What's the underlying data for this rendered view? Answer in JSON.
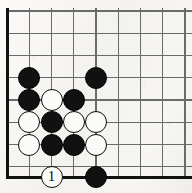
{
  "figure": {
    "kind": "go-board-diagram",
    "title": "",
    "board": {
      "width_px": 192,
      "height_px": 193,
      "background_color": "#f6f5f3",
      "line_color": "#6b6b6b",
      "edge_color": "#111111",
      "grid_spacing_px": 22.25,
      "stone_radius_px": 11,
      "columns_x": [
        7,
        29.25,
        51.5,
        73.75,
        96,
        118.25,
        140.5,
        162.75,
        185
      ],
      "rows_y": [
        11,
        33.25,
        55.5,
        77.75,
        100,
        122.25,
        144.5,
        166.75,
        178.5
      ],
      "edges": {
        "left": true,
        "bottom": true,
        "top": false,
        "right": false
      },
      "corner": "bottom-left"
    },
    "stones": [
      {
        "id": "b1",
        "color": "black",
        "col": 1,
        "row": 3,
        "x": 29.25,
        "y": 77.75,
        "label": ""
      },
      {
        "id": "b2",
        "color": "black",
        "col": 4,
        "row": 3,
        "x": 96.0,
        "y": 77.75,
        "label": ""
      },
      {
        "id": "b3",
        "color": "black",
        "col": 1,
        "row": 4,
        "x": 29.25,
        "y": 100.0,
        "label": ""
      },
      {
        "id": "w1",
        "color": "white",
        "col": 2,
        "row": 4,
        "x": 51.5,
        "y": 100.0,
        "label": ""
      },
      {
        "id": "b4",
        "color": "black",
        "col": 3,
        "row": 4,
        "x": 73.75,
        "y": 100.0,
        "label": ""
      },
      {
        "id": "w2",
        "color": "white",
        "col": 1,
        "row": 5,
        "x": 29.25,
        "y": 122.25,
        "label": ""
      },
      {
        "id": "b5",
        "color": "black",
        "col": 2,
        "row": 5,
        "x": 51.5,
        "y": 122.25,
        "label": ""
      },
      {
        "id": "w3",
        "color": "white",
        "col": 3,
        "row": 5,
        "x": 73.75,
        "y": 122.25,
        "label": ""
      },
      {
        "id": "w4",
        "color": "white",
        "col": 4,
        "row": 5,
        "x": 96.0,
        "y": 122.25,
        "label": ""
      },
      {
        "id": "w5",
        "color": "white",
        "col": 1,
        "row": 6,
        "x": 29.25,
        "y": 144.5,
        "label": ""
      },
      {
        "id": "b6",
        "color": "black",
        "col": 2,
        "row": 6,
        "x": 51.5,
        "y": 144.5,
        "label": ""
      },
      {
        "id": "b7",
        "color": "black",
        "col": 3,
        "row": 6,
        "x": 73.75,
        "y": 144.5,
        "label": ""
      },
      {
        "id": "w6",
        "color": "white",
        "col": 4,
        "row": 6,
        "x": 96.0,
        "y": 144.5,
        "label": ""
      },
      {
        "id": "w7",
        "color": "white",
        "col": 2,
        "row": 8,
        "x": 51.5,
        "y": 177.0,
        "label": "1"
      },
      {
        "id": "b8",
        "color": "black",
        "col": 4,
        "row": 8,
        "x": 96.0,
        "y": 177.0,
        "label": ""
      }
    ],
    "move_numbers": [
      "1"
    ],
    "colors": {
      "black_stone": "#111111",
      "white_stone": "#fbfbfa",
      "white_stone_outline": "#0a0a0a",
      "grid_line": "#6b6b6b",
      "board_edge": "#111111",
      "paper": "#f6f5f3"
    }
  }
}
